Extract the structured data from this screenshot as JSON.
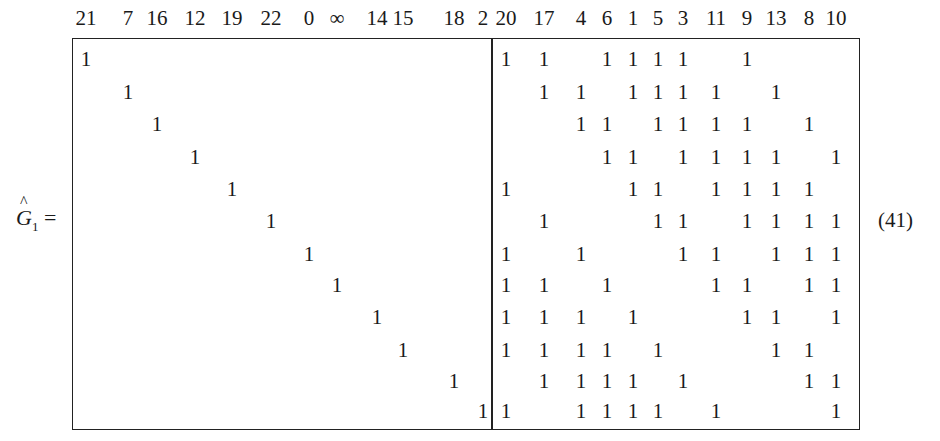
{
  "equation": {
    "lhs_symbol": "G",
    "lhs_hat": "^",
    "lhs_subscript": "1",
    "equals": "=",
    "number": "(41)"
  },
  "matrix": {
    "left_columns": [
      "21",
      "7",
      "16",
      "12",
      "19",
      "22",
      "0",
      "∞",
      "14",
      "15",
      "18",
      "2"
    ],
    "right_columns": [
      "20",
      "17",
      "4",
      "6",
      "1",
      "5",
      "3",
      "11",
      "9",
      "13",
      "8",
      "10"
    ],
    "left_block": "identity 12×12",
    "right_rows": [
      [
        "20",
        "17",
        "6",
        "1",
        "5",
        "3",
        "9"
      ],
      [
        "17",
        "4",
        "1",
        "5",
        "3",
        "11",
        "13"
      ],
      [
        "4",
        "6",
        "5",
        "3",
        "11",
        "9",
        "8"
      ],
      [
        "6",
        "1",
        "3",
        "11",
        "9",
        "13",
        "10"
      ],
      [
        "20",
        "1",
        "5",
        "11",
        "9",
        "13",
        "8"
      ],
      [
        "17",
        "5",
        "3",
        "9",
        "13",
        "8",
        "10"
      ],
      [
        "20",
        "4",
        "3",
        "11",
        "13",
        "8",
        "10"
      ],
      [
        "20",
        "17",
        "6",
        "11",
        "9",
        "8",
        "10"
      ],
      [
        "20",
        "17",
        "4",
        "1",
        "9",
        "13",
        "10"
      ],
      [
        "20",
        "17",
        "4",
        "6",
        "5",
        "13",
        "8"
      ],
      [
        "17",
        "4",
        "6",
        "1",
        "3",
        "8",
        "10"
      ],
      [
        "20",
        "4",
        "6",
        "1",
        "5",
        "11",
        "10"
      ]
    ],
    "entry_value": "1"
  }
}
